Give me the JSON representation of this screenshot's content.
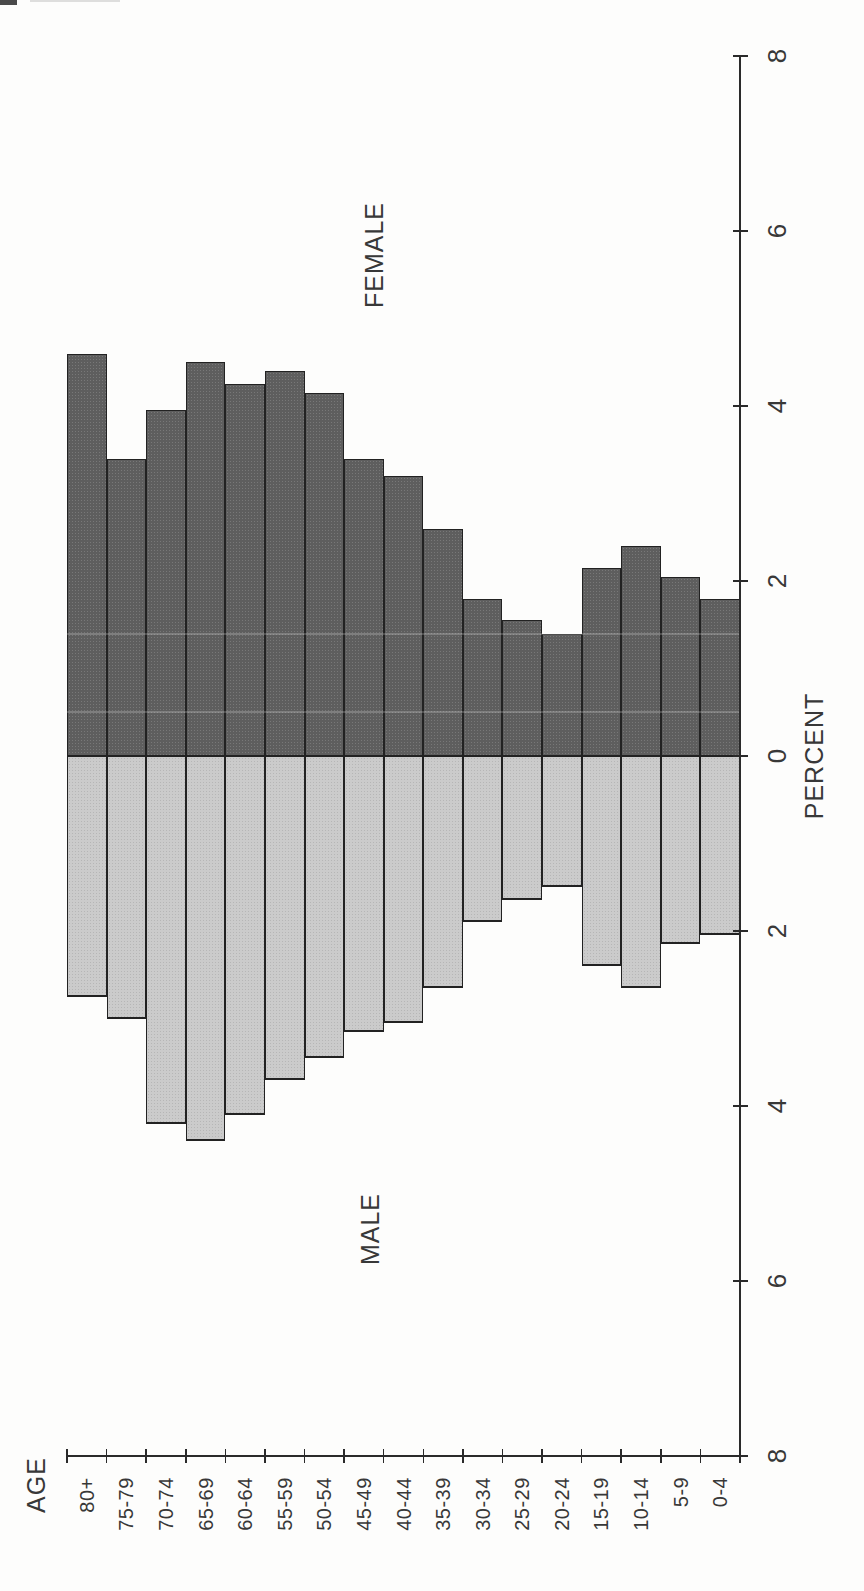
{
  "chart_data": {
    "type": "bar",
    "variant": "population-pyramid",
    "layout_note": "printed sideways: all text rotated 90deg CCW, female bars extend up, male bars extend down from center zero line, value axis vertical on right, age categories along bottom",
    "categories": [
      "80+",
      "75-79",
      "70-74",
      "65-69",
      "60-64",
      "55-59",
      "50-54",
      "45-49",
      "40-44",
      "35-39",
      "30-34",
      "25-29",
      "20-24",
      "15-19",
      "10-14",
      "5-9",
      "0-4"
    ],
    "series": [
      {
        "name": "FEMALE",
        "color": "#5e5e5e",
        "values": [
          4.6,
          3.4,
          3.95,
          4.5,
          4.25,
          4.4,
          4.15,
          3.4,
          3.2,
          2.6,
          1.8,
          1.55,
          1.4,
          2.15,
          2.4,
          2.05,
          1.8
        ]
      },
      {
        "name": "MALE",
        "color": "#cbcbcb",
        "values": [
          2.75,
          3.0,
          4.2,
          4.4,
          4.1,
          3.7,
          3.45,
          3.15,
          3.05,
          2.65,
          1.9,
          1.65,
          1.5,
          2.4,
          2.65,
          2.15,
          2.05
        ]
      }
    ],
    "value_axis": {
      "label": "PERCENT",
      "tick_positions": [
        8,
        6,
        4,
        2,
        0,
        -2,
        -4,
        -6,
        -8
      ],
      "tick_labels": [
        "8",
        "6",
        "4",
        "2",
        "0",
        "2",
        "4",
        "6",
        "8"
      ],
      "range": [
        -8,
        8
      ],
      "grid": false
    },
    "category_axis": {
      "label": "AGE"
    },
    "title": "",
    "legend": "none (series labeled by FEMALE / MALE annotations beside the bars)"
  }
}
